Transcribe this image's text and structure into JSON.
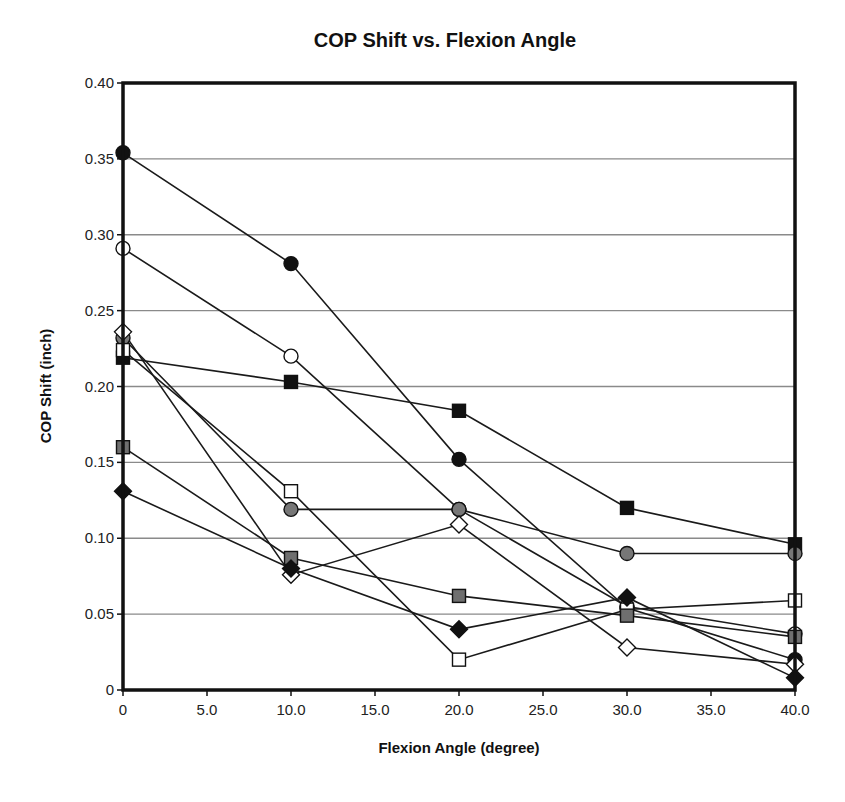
{
  "chart_data": {
    "type": "line",
    "title": "COP Shift vs. Flexion Angle",
    "xlabel": "Flexion Angle (degree)",
    "ylabel": "COP Shift (inch)",
    "xlim": [
      0,
      40
    ],
    "ylim": [
      0,
      0.4
    ],
    "x_ticks": [
      "0",
      "5.0",
      "10.0",
      "15.0",
      "20.0",
      "25.0",
      "30.0",
      "35.0",
      "40.0"
    ],
    "y_ticks": [
      "0",
      "0.05",
      "0.10",
      "0.15",
      "0.20",
      "0.25",
      "0.30",
      "0.35",
      "0.40"
    ],
    "grid": "horizontal",
    "legend": "none",
    "x": [
      0,
      10,
      20,
      30,
      40
    ],
    "series": [
      {
        "name": "black-circle",
        "marker": "circle",
        "fill": "#111111",
        "values": [
          0.354,
          0.281,
          0.152,
          0.054,
          0.02
        ]
      },
      {
        "name": "open-circle",
        "marker": "circle",
        "fill": "#ffffff",
        "values": [
          0.291,
          0.22,
          0.119,
          0.055,
          0.037
        ]
      },
      {
        "name": "black-square",
        "marker": "square",
        "fill": "#111111",
        "values": [
          0.219,
          0.203,
          0.184,
          0.12,
          0.096
        ]
      },
      {
        "name": "gray-circle",
        "marker": "circle",
        "fill": "#777777",
        "values": [
          0.232,
          0.119,
          0.119,
          0.09,
          0.09
        ]
      },
      {
        "name": "open-square",
        "marker": "square",
        "fill": "#ffffff",
        "values": [
          0.224,
          0.131,
          0.02,
          0.053,
          0.059
        ]
      },
      {
        "name": "open-diamond",
        "marker": "diamond",
        "fill": "#ffffff",
        "values": [
          0.236,
          0.076,
          0.109,
          0.028,
          0.017
        ]
      },
      {
        "name": "gray-square",
        "marker": "square",
        "fill": "#6f6f6f",
        "values": [
          0.16,
          0.087,
          0.062,
          0.049,
          0.035
        ]
      },
      {
        "name": "black-diamond",
        "marker": "diamond",
        "fill": "#111111",
        "values": [
          0.131,
          0.08,
          0.04,
          0.061,
          0.008
        ]
      }
    ]
  }
}
